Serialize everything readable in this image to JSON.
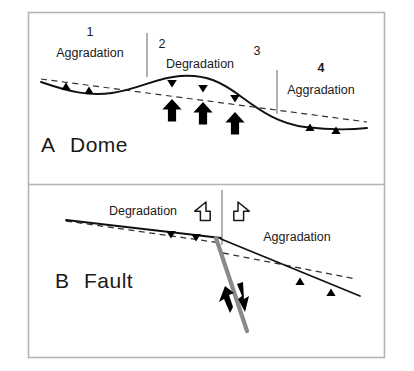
{
  "figure": {
    "panels": [
      {
        "id": "panel-a",
        "letter": "A",
        "title": "Dome",
        "zones": [
          {
            "number": "1",
            "label": "Aggradation",
            "bold_number": false
          },
          {
            "number": "2",
            "label": "Degradation",
            "bold_number": false
          },
          {
            "number": "3",
            "label": "",
            "bold_number": false
          },
          {
            "number": "4",
            "label": "Aggradation",
            "bold_number": true
          }
        ]
      },
      {
        "id": "panel-b",
        "letter": "B",
        "title": "Fault",
        "labels": {
          "left": "Degradation",
          "right": "Aggradation"
        }
      }
    ],
    "icons": {
      "up_triangle": "aggradation-triangle-icon",
      "down_triangle": "degradation-triangle-icon",
      "bold_up_arrow": "uplift-arrow-icon",
      "hollow_left_arrow": "extension-left-arrow-icon",
      "hollow_right_arrow": "extension-right-arrow-icon",
      "slip_arrow": "fault-slip-arrow-icon"
    },
    "colors": {
      "frame": "#b4b4b4",
      "line_solid": "#111111",
      "line_dashed": "#333333",
      "fault_gray": "#8a8a8a",
      "fill_black": "#000000",
      "background": "#ffffff"
    }
  }
}
